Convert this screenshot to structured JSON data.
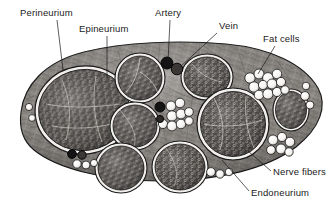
{
  "figure": {
    "type": "anatomical-diagram",
    "background_color": "#ffffff",
    "ink_color": "#1a1a1a"
  },
  "labels": [
    {
      "id": "perineurium",
      "text": "Perineurium",
      "x": 20,
      "y": 16,
      "anchor": "start",
      "leader": [
        [
          57,
          20
        ],
        [
          63,
          70
        ]
      ]
    },
    {
      "id": "epineurium",
      "text": "Epineurium",
      "x": 79,
      "y": 32,
      "anchor": "start",
      "leader": [
        [
          107,
          36
        ],
        [
          107,
          78
        ]
      ]
    },
    {
      "id": "artery",
      "text": "Artery",
      "x": 155,
      "y": 16,
      "anchor": "start",
      "leader": [
        [
          170,
          20
        ],
        [
          168,
          62
        ]
      ]
    },
    {
      "id": "vein",
      "text": "Vein",
      "x": 219,
      "y": 29,
      "anchor": "start",
      "leader": [
        [
          217,
          33
        ],
        [
          180,
          67
        ]
      ]
    },
    {
      "id": "fat-cells",
      "text": "Fat cells",
      "x": 263,
      "y": 42,
      "anchor": "start",
      "leader": [
        [
          275,
          46
        ],
        [
          258,
          74
        ]
      ]
    },
    {
      "id": "nerve-fibers",
      "text": "Nerve fibers",
      "x": 273,
      "y": 175,
      "anchor": "start",
      "leader": [
        [
          271,
          171
        ],
        [
          248,
          151
        ]
      ]
    },
    {
      "id": "endoneurium",
      "text": "Endoneurium",
      "x": 251,
      "y": 196,
      "anchor": "start",
      "leader": [
        [
          249,
          191
        ],
        [
          222,
          160
        ]
      ]
    }
  ],
  "structures": {
    "epineurium_outline": "M 21,112 C 24,86 44,62 84,52 C 124,42 180,40 226,44 C 270,48 304,64 318,88 C 328,106 320,128 296,147 C 268,168 220,181 160,181 C 104,181 56,168 34,150 C 23,141 19,127 21,112 Z",
    "perineurium_color": "#f2f0ec",
    "fascicle_fill": "#585552",
    "fat_cell_fill": "#f6f5f2",
    "vessel_fill": "#1a1a1a",
    "fascicles": [
      {
        "id": "fascicle-left-large",
        "cx": 84,
        "cy": 110,
        "rx": 49,
        "ry": 44,
        "rot": -8
      },
      {
        "id": "fascicle-top-mid",
        "cx": 140,
        "cy": 78,
        "rx": 25,
        "ry": 23,
        "rot": 0
      },
      {
        "id": "fascicle-top-right",
        "cx": 207,
        "cy": 77,
        "rx": 26,
        "ry": 23,
        "rot": 0
      },
      {
        "id": "fascicle-center",
        "cx": 135,
        "cy": 126,
        "rx": 25,
        "ry": 24,
        "rot": 0
      },
      {
        "id": "fascicle-right-big",
        "cx": 233,
        "cy": 124,
        "rx": 36,
        "ry": 34,
        "rot": 0
      },
      {
        "id": "fascicle-bottom-left",
        "cx": 121,
        "cy": 168,
        "rx": 26,
        "ry": 25,
        "rot": 0
      },
      {
        "id": "fascicle-bottom-mid",
        "cx": 180,
        "cy": 167,
        "rx": 28,
        "ry": 26,
        "rot": 0
      },
      {
        "id": "fascicle-far-right",
        "cx": 291,
        "cy": 110,
        "rx": 18,
        "ry": 21,
        "rot": 0
      }
    ],
    "vessels": [
      {
        "id": "artery-main",
        "cx": 167,
        "cy": 63,
        "r": 6.0,
        "shade": "#141414"
      },
      {
        "id": "vein-main",
        "cx": 177,
        "cy": 68,
        "r": 5.8,
        "shade": "#3a3734"
      },
      {
        "id": "vessel-center",
        "cx": 160,
        "cy": 107,
        "r": 5.0,
        "shade": "#141414"
      },
      {
        "id": "vessel-center-2",
        "cx": 160,
        "cy": 119,
        "r": 3.6,
        "shade": "#2b2825"
      },
      {
        "id": "vessel-lower-left",
        "cx": 72,
        "cy": 154,
        "r": 4.4,
        "shade": "#141414"
      },
      {
        "id": "vessel-lower-left-2",
        "cx": 82,
        "cy": 155,
        "r": 4.2,
        "shade": "#3a3734"
      }
    ],
    "fat_cell_clusters": [
      {
        "id": "fat-cluster-upper-right",
        "cells": [
          [
            250,
            78
          ],
          [
            259,
            74
          ],
          [
            268,
            78
          ],
          [
            276,
            74
          ],
          [
            254,
            87
          ],
          [
            263,
            85
          ],
          [
            272,
            84
          ],
          [
            281,
            82
          ],
          [
            259,
            95
          ],
          [
            268,
            94
          ],
          [
            277,
            92
          ],
          [
            285,
            90
          ]
        ]
      },
      {
        "id": "fat-cluster-center",
        "cells": [
          [
            171,
            106
          ],
          [
            180,
            103
          ],
          [
            172,
            116
          ],
          [
            181,
            114
          ],
          [
            163,
            124
          ],
          [
            172,
            125
          ],
          [
            181,
            123
          ],
          [
            189,
            112
          ],
          [
            189,
            122
          ]
        ]
      },
      {
        "id": "fat-cluster-right-lower",
        "cells": [
          [
            272,
            140
          ],
          [
            281,
            136
          ],
          [
            289,
            142
          ],
          [
            280,
            149
          ],
          [
            270,
            150
          ],
          [
            288,
            152
          ]
        ]
      },
      {
        "id": "fat-cluster-left-edge",
        "cells": [
          [
            28,
            107
          ],
          [
            31,
            118
          ]
        ]
      },
      {
        "id": "fat-cluster-bottom-left",
        "cells": [
          [
            76,
            163
          ],
          [
            85,
            164
          ],
          [
            93,
            163
          ]
        ]
      },
      {
        "id": "fat-cluster-bottom-right",
        "cells": [
          [
            210,
            171
          ],
          [
            219,
            173
          ],
          [
            228,
            172
          ]
        ]
      },
      {
        "id": "fat-cluster-far-right",
        "cells": [
          [
            302,
            96
          ],
          [
            308,
            104
          ],
          [
            304,
            86
          ]
        ]
      }
    ]
  }
}
